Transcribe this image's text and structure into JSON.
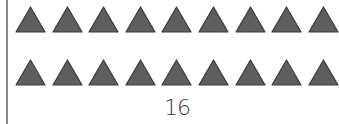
{
  "figure": {
    "rows": [
      {
        "shape": "triangle",
        "count": 9
      },
      {
        "shape": "triangle",
        "count": 9
      }
    ],
    "triangle_fill": "#5e5e5e",
    "triangle_stroke": "#3a3a3a",
    "label": "16"
  }
}
